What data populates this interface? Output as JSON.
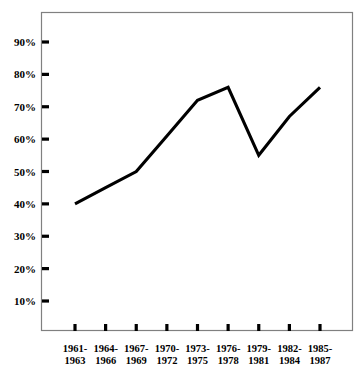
{
  "chart_data": {
    "type": "line",
    "title": "",
    "subtitle": "",
    "xlabel": "",
    "ylabel": "",
    "categories": [
      "1961-\n1963",
      "1964-\n1966",
      "1967-\n1969",
      "1970-\n1972",
      "1973-\n1975",
      "1976-\n1978",
      "1979-\n1981",
      "1982-\n1984",
      "1985-\n1987"
    ],
    "category_lines": [
      [
        "1961-",
        "1963"
      ],
      [
        "1964-",
        "1966"
      ],
      [
        "1967-",
        "1969"
      ],
      [
        "1970-",
        "1972"
      ],
      [
        "1973-",
        "1975"
      ],
      [
        "1976-",
        "1978"
      ],
      [
        "1979-",
        "1981"
      ],
      [
        "1982-",
        "1984"
      ],
      [
        "1985-",
        "1987"
      ]
    ],
    "values": [
      40,
      45,
      50,
      61,
      72,
      76,
      55,
      67,
      76
    ],
    "value_labels": [
      "40%",
      "45%",
      "50%",
      "61%",
      "72%",
      "76%",
      "55%",
      "67%",
      "76%"
    ],
    "ylim": [
      0,
      95
    ],
    "ytick_values": [
      10,
      20,
      30,
      40,
      50,
      60,
      70,
      80,
      90
    ],
    "ytick_labels": [
      "10%",
      "20%",
      "30%",
      "40%",
      "50%",
      "60%",
      "70%",
      "80%",
      "90%"
    ],
    "grid": false,
    "legend": null,
    "legend_position": "none",
    "series": [
      {
        "name": "",
        "values": [
          40,
          45,
          50,
          61,
          72,
          76,
          55,
          67,
          76
        ],
        "color": "#000000"
      }
    ],
    "colors": {
      "line": "#000000",
      "frame": "#808080",
      "tick": "#000000",
      "text": "#000000",
      "background": "#ffffff"
    }
  }
}
